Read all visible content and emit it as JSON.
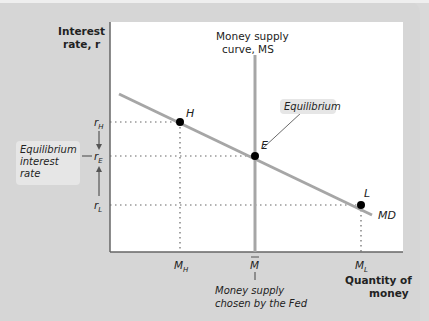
{
  "diagram": {
    "y_axis_label_line1": "Interest",
    "y_axis_label_line2": "rate, r",
    "x_axis_label_line1": "Quantity of",
    "x_axis_label_line2": "money",
    "ms_label_line1": "Money supply",
    "ms_label_line2": "curve, MS",
    "md_label": "MD",
    "points": {
      "H": "H",
      "E": "E",
      "L": "L"
    },
    "y_ticks": {
      "rH": "r",
      "rH_sub": "H",
      "rE": "r",
      "rE_sub": "E",
      "rL": "r",
      "rL_sub": "L"
    },
    "x_ticks": {
      "MH": "M",
      "MH_sub": "H",
      "Mbar": "M",
      "ML": "M",
      "ML_sub": "L"
    },
    "equilibrium_callout": "Equilibrium",
    "eq_rate_line1": "Equilibrium",
    "eq_rate_line2": "interest",
    "eq_rate_line3": "rate",
    "fed_line1": "Money supply",
    "fed_line2": "chosen by the Fed"
  },
  "colors": {
    "curve": "#a6a6a6",
    "point": "#000000",
    "panel": "#d6d6d6",
    "plot": "#ffffff"
  }
}
